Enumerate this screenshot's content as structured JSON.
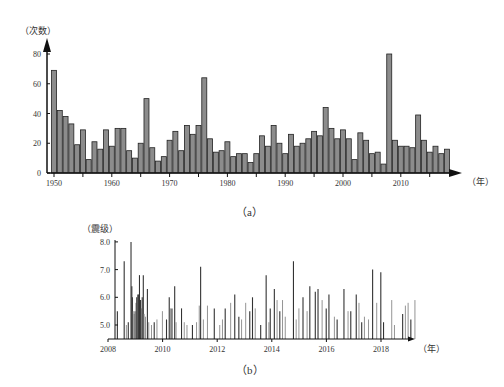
{
  "chart_data": [
    {
      "panel": "a",
      "type": "bar",
      "caption": "（a）",
      "ylabel": "（次数）",
      "xlabel": "（年）",
      "ylim": [
        0,
        80
      ],
      "yticks": [
        "0",
        "20",
        "40",
        "60",
        "80"
      ],
      "xticks": [
        "1950",
        "1960",
        "1970",
        "1980",
        "1990",
        "2000",
        "2010"
      ],
      "grid": false,
      "bar_color": "#8c8c8c",
      "bar_edge": "#222222",
      "categories": [
        1950,
        1951,
        1952,
        1953,
        1954,
        1955,
        1956,
        1957,
        1958,
        1959,
        1960,
        1961,
        1962,
        1963,
        1964,
        1965,
        1966,
        1967,
        1968,
        1969,
        1970,
        1971,
        1972,
        1973,
        1974,
        1975,
        1976,
        1977,
        1978,
        1979,
        1980,
        1981,
        1982,
        1983,
        1984,
        1985,
        1986,
        1987,
        1988,
        1989,
        1990,
        1991,
        1992,
        1993,
        1994,
        1995,
        1996,
        1997,
        1998,
        1999,
        2000,
        2001,
        2002,
        2003,
        2004,
        2005,
        2006,
        2007,
        2008,
        2009,
        2010,
        2011,
        2012,
        2013,
        2014,
        2015,
        2016,
        2017,
        2018
      ],
      "values": [
        69,
        42,
        38,
        33,
        19,
        29,
        9,
        21,
        16,
        29,
        18,
        30,
        30,
        15,
        10,
        20,
        50,
        17,
        8,
        11,
        22,
        28,
        15,
        32,
        26,
        32,
        64,
        23,
        14,
        15,
        21,
        11,
        13,
        13,
        7,
        13,
        25,
        18,
        32,
        20,
        13,
        26,
        18,
        20,
        23,
        28,
        25,
        44,
        30,
        23,
        29,
        23,
        9,
        27,
        22,
        13,
        14,
        6,
        80,
        22,
        18,
        18,
        17,
        39,
        22,
        14,
        18,
        13,
        16
      ]
    },
    {
      "panel": "b",
      "type": "bar",
      "caption": "（b）",
      "ylabel": "（震级）",
      "xlabel": "（年）",
      "ylim": [
        4.5,
        8.0
      ],
      "yticks": [
        "5.0",
        "6.0",
        "7.0",
        "8.0"
      ],
      "xticks": [
        "2008",
        "2010",
        "2012",
        "2014",
        "2016",
        "2018"
      ],
      "grid": false,
      "note": "Each vertical line is one earthquake event; magnitude read from line top.",
      "events": [
        {
          "t": 2008.05,
          "m": 5.5
        },
        {
          "t": 2008.3,
          "m": 7.3
        },
        {
          "t": 2008.38,
          "m": 5.0
        },
        {
          "t": 2008.45,
          "m": 5.1
        },
        {
          "t": 2008.55,
          "m": 8.0
        },
        {
          "t": 2008.58,
          "m": 6.4
        },
        {
          "t": 2008.6,
          "m": 6.0
        },
        {
          "t": 2008.63,
          "m": 5.5
        },
        {
          "t": 2008.66,
          "m": 5.4
        },
        {
          "t": 2008.7,
          "m": 5.5
        },
        {
          "t": 2008.73,
          "m": 5.8
        },
        {
          "t": 2008.76,
          "m": 6.0
        },
        {
          "t": 2008.8,
          "m": 6.1
        },
        {
          "t": 2008.83,
          "m": 6.1
        },
        {
          "t": 2008.86,
          "m": 6.8
        },
        {
          "t": 2008.9,
          "m": 5.9
        },
        {
          "t": 2008.93,
          "m": 5.6
        },
        {
          "t": 2008.96,
          "m": 6.0
        },
        {
          "t": 2009.0,
          "m": 6.8
        },
        {
          "t": 2009.03,
          "m": 5.4
        },
        {
          "t": 2009.08,
          "m": 5.3
        },
        {
          "t": 2009.15,
          "m": 6.3
        },
        {
          "t": 2009.2,
          "m": 5.1
        },
        {
          "t": 2009.3,
          "m": 5.0
        },
        {
          "t": 2009.4,
          "m": 5.1
        },
        {
          "t": 2009.5,
          "m": 5.2
        },
        {
          "t": 2009.7,
          "m": 5.5
        },
        {
          "t": 2009.85,
          "m": 5.2
        },
        {
          "t": 2009.95,
          "m": 6.0
        },
        {
          "t": 2010.0,
          "m": 5.6
        },
        {
          "t": 2010.05,
          "m": 5.6
        },
        {
          "t": 2010.15,
          "m": 6.4
        },
        {
          "t": 2010.2,
          "m": 5.1
        },
        {
          "t": 2010.4,
          "m": 5.6
        },
        {
          "t": 2010.5,
          "m": 5.1
        },
        {
          "t": 2010.6,
          "m": 5.0
        },
        {
          "t": 2010.8,
          "m": 5.0
        },
        {
          "t": 2010.95,
          "m": 5.1
        },
        {
          "t": 2011.05,
          "m": 5.7
        },
        {
          "t": 2011.1,
          "m": 7.1
        },
        {
          "t": 2011.2,
          "m": 5.2
        },
        {
          "t": 2011.35,
          "m": 5.7
        },
        {
          "t": 2011.6,
          "m": 5.6
        },
        {
          "t": 2011.8,
          "m": 5.0
        },
        {
          "t": 2011.9,
          "m": 5.2
        },
        {
          "t": 2012.0,
          "m": 5.6
        },
        {
          "t": 2012.2,
          "m": 5.8
        },
        {
          "t": 2012.35,
          "m": 6.1
        },
        {
          "t": 2012.5,
          "m": 5.3
        },
        {
          "t": 2012.6,
          "m": 5.2
        },
        {
          "t": 2012.75,
          "m": 5.8
        },
        {
          "t": 2012.9,
          "m": 5.5
        },
        {
          "t": 2013.0,
          "m": 6.0
        },
        {
          "t": 2013.1,
          "m": 5.6
        },
        {
          "t": 2013.3,
          "m": 5.0
        },
        {
          "t": 2013.5,
          "m": 6.8
        },
        {
          "t": 2013.6,
          "m": 5.1
        },
        {
          "t": 2013.65,
          "m": 5.6
        },
        {
          "t": 2013.8,
          "m": 6.3
        },
        {
          "t": 2013.9,
          "m": 5.9
        },
        {
          "t": 2014.0,
          "m": 5.5
        },
        {
          "t": 2014.1,
          "m": 5.9
        },
        {
          "t": 2014.2,
          "m": 5.3
        },
        {
          "t": 2014.5,
          "m": 7.3
        },
        {
          "t": 2014.6,
          "m": 5.2
        },
        {
          "t": 2014.7,
          "m": 5.6
        },
        {
          "t": 2014.85,
          "m": 6.0
        },
        {
          "t": 2015.0,
          "m": 5.5
        },
        {
          "t": 2015.1,
          "m": 6.4
        },
        {
          "t": 2015.3,
          "m": 6.2
        },
        {
          "t": 2015.4,
          "m": 6.3
        },
        {
          "t": 2015.55,
          "m": 5.9
        },
        {
          "t": 2015.7,
          "m": 5.6
        },
        {
          "t": 2015.8,
          "m": 6.1
        },
        {
          "t": 2016.0,
          "m": 5.3
        },
        {
          "t": 2016.1,
          "m": 5.2
        },
        {
          "t": 2016.35,
          "m": 6.3
        },
        {
          "t": 2016.5,
          "m": 5.5
        },
        {
          "t": 2016.6,
          "m": 5.5
        },
        {
          "t": 2016.8,
          "m": 6.1
        },
        {
          "t": 2016.9,
          "m": 5.8
        },
        {
          "t": 2017.0,
          "m": 5.1
        },
        {
          "t": 2017.1,
          "m": 5.3
        },
        {
          "t": 2017.25,
          "m": 5.2
        },
        {
          "t": 2017.4,
          "m": 7.0
        },
        {
          "t": 2017.55,
          "m": 5.8
        },
        {
          "t": 2017.7,
          "m": 6.9
        },
        {
          "t": 2017.8,
          "m": 5.1
        },
        {
          "t": 2018.1,
          "m": 5.9
        },
        {
          "t": 2018.2,
          "m": 5.0
        },
        {
          "t": 2018.5,
          "m": 5.4
        },
        {
          "t": 2018.6,
          "m": 5.7
        },
        {
          "t": 2018.7,
          "m": 5.8
        },
        {
          "t": 2018.8,
          "m": 5.2
        },
        {
          "t": 2018.95,
          "m": 5.9
        }
      ]
    }
  ]
}
